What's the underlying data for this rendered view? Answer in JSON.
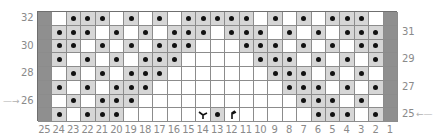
{
  "chart": {
    "columns_left_to_right": [
      25,
      24,
      23,
      22,
      21,
      20,
      19,
      18,
      17,
      16,
      15,
      14,
      13,
      12,
      11,
      10,
      9,
      8,
      7,
      6,
      5,
      4,
      3,
      2,
      1
    ],
    "rows_top_to_bottom": [
      32,
      31,
      30,
      29,
      28,
      27,
      26,
      25
    ],
    "left_row_labels": [
      {
        "row": 32,
        "label": "32"
      },
      {
        "row": 30,
        "label": "30"
      },
      {
        "row": 28,
        "label": "28"
      },
      {
        "row": 26,
        "label": "26"
      }
    ],
    "right_row_labels": [
      {
        "row": 31,
        "label": "31"
      },
      {
        "row": 29,
        "label": "29"
      },
      {
        "row": 27,
        "label": "27"
      },
      {
        "row": 25,
        "label": "25"
      }
    ],
    "left_arrow_row": 26,
    "left_arrow_glyph": "→",
    "right_arrow_row": 25,
    "right_arrow_glyph": "←",
    "legend_codes": {
      "E": "edge stitch (dark grey)",
      ".": "knit (white)",
      "P": "purl (grey with dot)",
      "L": "left-leaning decrease",
      "R": "right-leaning decrease"
    },
    "grid": [
      "E.PPP.P.P.PPPPP.P.P.PPP.E",
      "EPPP.P.P.PPP.PPP.P.P.PPPE",
      "EPP.P.P.PPP...PPP.P.P.PPE",
      "EP.P.P.PPP.....PPP.P.P.PE",
      "E.P.P.PPP.......PPP.P.P.E",
      "EP.P.PPP.........PPP.P.PE",
      "E.P.PPP...........PPP.P.E",
      "EP.PPP.....LPR.....PPP.PE"
    ],
    "colors": {
      "edge": "#8f8f8f",
      "purl_bg": "#d6d6d6",
      "knit_bg": "#ffffff",
      "dot": "#111111",
      "grid_line": "#8c8c8c",
      "label": "#8a8a8a"
    }
  }
}
